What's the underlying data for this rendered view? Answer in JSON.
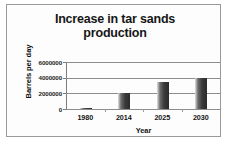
{
  "chart_data": {
    "type": "bar",
    "title": "Increase in tar sands production",
    "title_lines": [
      "Increase in tar sands",
      "production"
    ],
    "xlabel": "Year",
    "ylabel": "Barrels per day",
    "categories": [
      "1980",
      "2014",
      "2025",
      "2030"
    ],
    "values": [
      100000,
      2000000,
      3400000,
      4000000
    ],
    "ylim": [
      0,
      6000000
    ],
    "ytick_labels": [
      "0",
      "2000000",
      "4000000",
      "6000000"
    ],
    "ytick_values": [
      0,
      2000000,
      4000000,
      6000000
    ],
    "grid": true,
    "legend": false,
    "bar_color": "#3a3a3a",
    "gridline_color": "#8d8d8d",
    "frame_color": "#9a9a9a"
  }
}
